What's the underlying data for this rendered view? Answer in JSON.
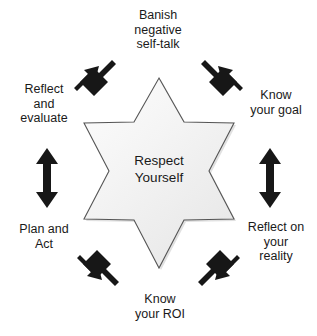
{
  "diagram": {
    "center": {
      "text": "Respect\nYourself",
      "shape": "six-pointed-star",
      "fill_color": "#f2f2f2",
      "outline_color": "#4d4d4d"
    },
    "arrow_color": "#171717",
    "background_color": "#ffffff",
    "nodes": [
      {
        "id": "top",
        "label": "Banish\nnegative\nself-talk",
        "position": "top",
        "arrow": "double-headed-diagonal"
      },
      {
        "id": "upper-right",
        "label": "Know\nyour goal",
        "position": "upper-right",
        "arrow": "double-headed-diagonal"
      },
      {
        "id": "lower-right",
        "label": "Reflect on\nyour\nreality",
        "position": "lower-right",
        "arrow": "double-headed-vertical"
      },
      {
        "id": "bottom",
        "label": "Know\nyour ROI",
        "position": "bottom",
        "arrow": "double-headed-diagonal"
      },
      {
        "id": "lower-left",
        "label": "Plan and\nAct",
        "position": "lower-left",
        "arrow": "double-headed-diagonal"
      },
      {
        "id": "upper-left",
        "label": "Reflect\nand\nevaluate",
        "position": "upper-left",
        "arrow": "double-headed-vertical"
      }
    ]
  }
}
